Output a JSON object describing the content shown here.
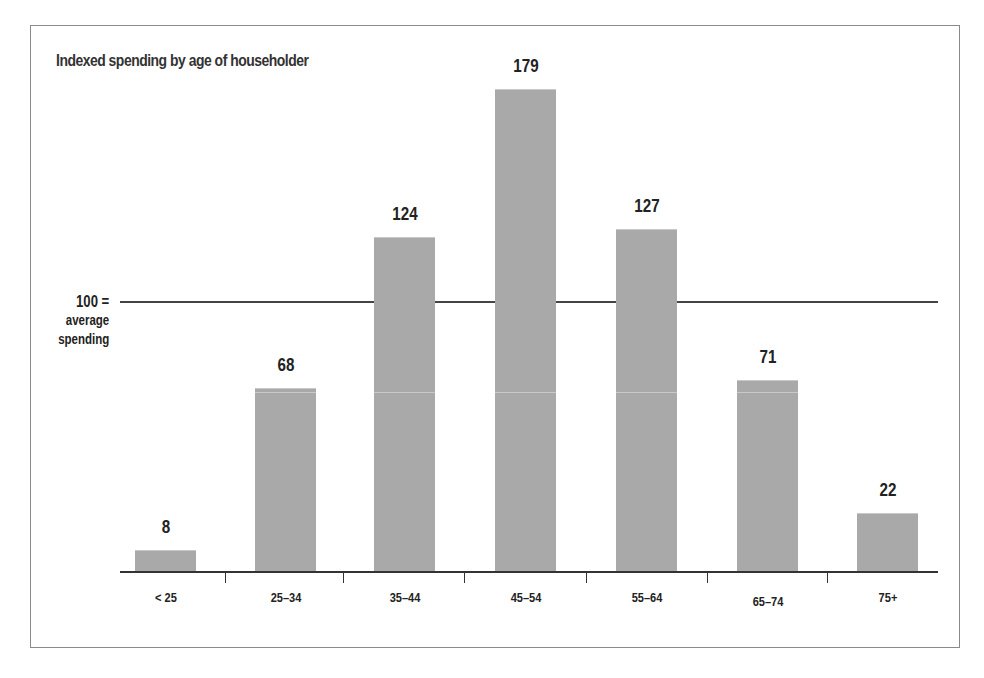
{
  "chart_data": {
    "type": "bar",
    "title": "Indexed spending by age of householder",
    "categories": [
      "< 25",
      "25–34",
      "35–44",
      "45–54",
      "55–64",
      "65–74",
      "75+"
    ],
    "values": [
      8,
      68,
      124,
      179,
      127,
      71,
      22
    ],
    "xlabel": "",
    "ylabel": "",
    "ylim": [
      0,
      190
    ],
    "reference_line": {
      "value": 100,
      "label": [
        "100 =",
        "average",
        "spending"
      ]
    },
    "grid": false,
    "legend": null,
    "bar_color": "#a9a9a9"
  },
  "chart": {
    "title": "Indexed spending by age of householder",
    "ref_label": {
      "line1": "100 =",
      "line2": "average",
      "line3": "spending"
    },
    "bars": [
      {
        "label": "< 25",
        "value": "8"
      },
      {
        "label": "25–34",
        "value": "68"
      },
      {
        "label": "35–44",
        "value": "124"
      },
      {
        "label": "45–54",
        "value": "179"
      },
      {
        "label": "55–64",
        "value": "127"
      },
      {
        "label": "65–74",
        "value": "71"
      },
      {
        "label": "75+",
        "value": "22"
      }
    ]
  }
}
